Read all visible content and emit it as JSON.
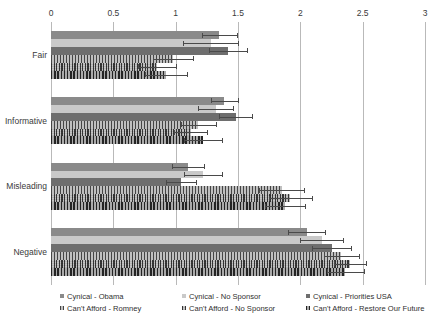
{
  "chart_data": {
    "type": "bar",
    "orientation": "horizontal",
    "title": "",
    "subtitle": "",
    "xlabel": "",
    "ylabel": "",
    "xlim": [
      0,
      3
    ],
    "ylim": null,
    "grid": true,
    "legend_position": "bottom",
    "xticks": [
      "0",
      "0.5",
      "1",
      "1.5",
      "2",
      "2.5",
      "3"
    ],
    "xtick_values": [
      0,
      0.5,
      1,
      1.5,
      2,
      2.5,
      3
    ],
    "categories": [
      "Fair",
      "Informative",
      "Misleading",
      "Negative"
    ],
    "series": [
      {
        "name": "Cynical - Obama",
        "color": "#8a8a8a",
        "pattern": "solid",
        "values": [
          1.35,
          1.39,
          1.1,
          2.05
        ],
        "errors": [
          0.14,
          0.11,
          0.13,
          0.15
        ]
      },
      {
        "name": "Cynical - No Sponsor",
        "color": "#c9c9c9",
        "pattern": "solid",
        "values": [
          1.28,
          1.32,
          1.22,
          2.17
        ],
        "errors": [
          0.22,
          0.14,
          0.15,
          0.17
        ]
      },
      {
        "name": "Cynical - Priorities USA",
        "color": "#6e6e6e",
        "pattern": "solid",
        "values": [
          1.42,
          1.48,
          1.04,
          2.25
        ],
        "errors": [
          0.15,
          0.13,
          0.12,
          0.16
        ]
      },
      {
        "name": "Can't Afford - Romney",
        "color": "#9d9d9d",
        "pattern": "vertical-hatch",
        "values": [
          0.98,
          1.18,
          1.85,
          2.33
        ],
        "errors": [
          0.16,
          0.14,
          0.18,
          0.14
        ]
      },
      {
        "name": "Can't Afford - No Sponsor",
        "color": "#8f8f8f",
        "pattern": "cross-hatch",
        "values": [
          0.85,
          1.12,
          1.92,
          2.4
        ],
        "errors": [
          0.15,
          0.13,
          0.17,
          0.13
        ]
      },
      {
        "name": "Can't Afford - Restore Our Future",
        "color": "#7d7d7d",
        "pattern": "dense-hatch",
        "values": [
          0.92,
          1.22,
          1.88,
          2.36
        ],
        "errors": [
          0.17,
          0.15,
          0.16,
          0.15
        ]
      }
    ]
  },
  "legend": {
    "items": [
      {
        "label": "Cynical - Obama",
        "marker": "square-swatch"
      },
      {
        "label": "Cynical - No Sponsor",
        "marker": "square-swatch"
      },
      {
        "label": "Cynical - Priorities USA",
        "marker": "square-swatch"
      },
      {
        "label": "Can't Afford - Romney",
        "marker": "square-swatch"
      },
      {
        "label": "Can't Afford - No Sponsor",
        "marker": "square-swatch"
      },
      {
        "label": "Can't Afford - Restore Our Future",
        "marker": "square-swatch"
      }
    ]
  },
  "colors": {
    "grid": "#b9b9b9",
    "text": "#333333",
    "error_bar": "#4a4a4a",
    "background": "#ffffff"
  }
}
